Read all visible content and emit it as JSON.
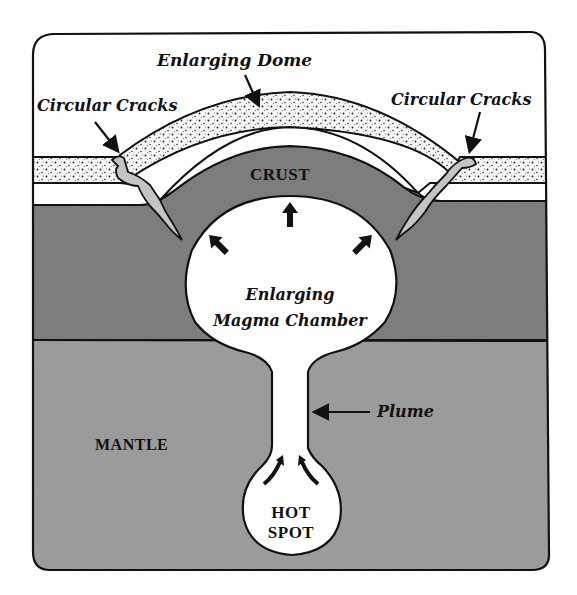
{
  "diagram": {
    "type": "geology cross-section",
    "colors": {
      "background": "#ffffff",
      "outline": "#111111",
      "crust": "#7e7e7e",
      "mantle": "#9c9c9c",
      "magma": "#ffffff",
      "crack_fill": "#c4c4c4",
      "stipple_layer": "#f4f4f4"
    },
    "labels": {
      "enlarging_dome": "Enlarging Dome",
      "circular_cracks_left": "Circular Cracks",
      "circular_cracks_right": "Circular Cracks",
      "crust": "CRUST",
      "magma_chamber_line1": "Enlarging",
      "magma_chamber_line2": "Magma Chamber",
      "plume": "Plume",
      "mantle": "MANTLE",
      "hot_spot_line1": "HOT",
      "hot_spot_line2": "SPOT"
    },
    "layers": [
      "Enlarging Dome (stippled surface layer)",
      "CRUST",
      "MANTLE"
    ],
    "features": [
      "Circular Cracks",
      "Enlarging Magma Chamber",
      "Plume",
      "HOT SPOT"
    ]
  }
}
